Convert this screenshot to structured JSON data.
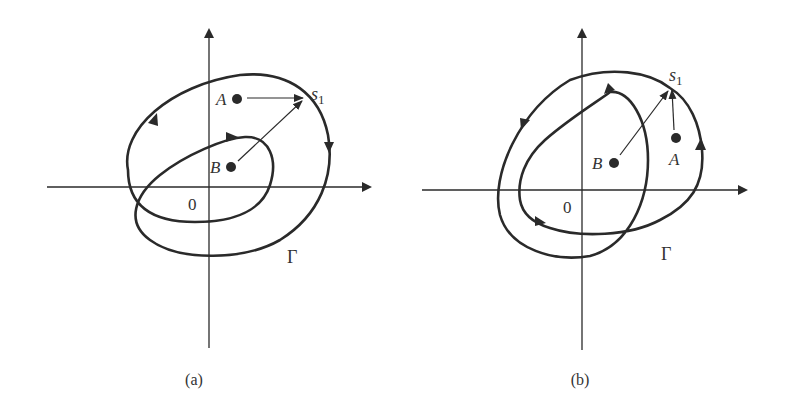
{
  "figure": {
    "panels": [
      {
        "id": "a",
        "caption": "(a)",
        "origin_label": "0",
        "curve_label": "Γ",
        "points": [
          {
            "name": "A",
            "label": "A"
          },
          {
            "name": "B",
            "label": "B"
          }
        ],
        "target_label": "s",
        "target_subscript": "1",
        "orientation": "clockwise"
      },
      {
        "id": "b",
        "caption": "(b)",
        "origin_label": "0",
        "curve_label": "Γ",
        "points": [
          {
            "name": "A",
            "label": "A"
          },
          {
            "name": "B",
            "label": "B"
          }
        ],
        "target_label": "s",
        "target_subscript": "1",
        "orientation": "counterclockwise"
      }
    ],
    "colors": {
      "ink": "#2a2a2a",
      "background": "#ffffff"
    }
  }
}
